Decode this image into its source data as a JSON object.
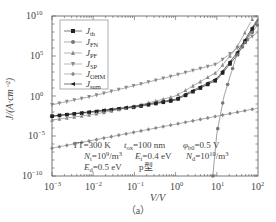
{
  "chart_data": {
    "type": "line",
    "title": "",
    "xlabel": "V/V",
    "ylabel": "J/(A·cm⁻²)",
    "xscale": "log",
    "yscale": "log",
    "xlim": [
      0.001,
      100
    ],
    "ylim": [
      1e-10,
      10000000000.0
    ],
    "x_ticks": [
      "10^-3",
      "10^-2",
      "10^-1",
      "10^0",
      "10^1",
      "10^2"
    ],
    "y_ticks": [
      "10^-10",
      "10^-5",
      "10^0",
      "10^5",
      "10^10"
    ],
    "grid": false,
    "legend_position": "upper left",
    "series": [
      {
        "name": "J_th",
        "marker": "square",
        "color": "#222222",
        "x": [
          0.001,
          0.01,
          0.1,
          1,
          10,
          30,
          100
        ],
        "y": [
          0.003,
          0.01,
          0.04,
          0.3,
          100,
          100000.0,
          3000000000.0
        ]
      },
      {
        "name": "J_FN",
        "marker": "circle",
        "color": "#777777",
        "x": [
          8,
          10,
          15,
          30,
          100
        ],
        "y": [
          1e-10,
          2e-05,
          1,
          100000.0,
          1000000000.0
        ]
      },
      {
        "name": "J_PF",
        "marker": "triangle-up",
        "color": "#888888",
        "x": [
          0.001,
          0.01,
          0.1,
          1,
          10,
          30,
          80
        ],
        "y": [
          0.001,
          0.005,
          0.05,
          1,
          1000,
          1000000.0,
          10000000000.0
        ]
      },
      {
        "name": "J_SP",
        "marker": "triangle-down",
        "color": "#888888",
        "x": [
          0.001,
          0.01,
          0.1,
          1,
          10,
          100
        ],
        "y": [
          0.08,
          1,
          20,
          400,
          10000.0,
          100000000.0
        ]
      },
      {
        "name": "J_OHM",
        "marker": "diamond",
        "color": "#888888",
        "x": [
          0.001,
          0.01,
          0.1,
          1,
          10,
          100
        ],
        "y": [
          3e-07,
          3e-06,
          3e-05,
          0.0003,
          0.003,
          0.03
        ]
      },
      {
        "name": "J_sum",
        "marker": "triangle-left",
        "color": "#222222",
        "x": [
          0.001,
          0.01,
          0.1,
          1,
          10,
          30,
          100
        ],
        "y": [
          0.003,
          0.012,
          0.05,
          0.4,
          150,
          200000.0,
          5000000000.0
        ]
      }
    ],
    "annotations": [
      "T=300 K",
      "t_ox=100 nm",
      "φ_b0=0.5 V",
      "N_t=10^9/m^3",
      "E_t=0.4 eV",
      "N_d=10^10/m^3",
      "E_d=0.5 eV",
      "p型"
    ]
  },
  "axes": {
    "xlabel": "V/V",
    "ylabel": "J/(A·cm⁻²)",
    "x_ticks": [
      {
        "base": "10",
        "exp": "−3"
      },
      {
        "base": "10",
        "exp": "−2"
      },
      {
        "base": "10",
        "exp": "−1"
      },
      {
        "base": "10",
        "exp": "0"
      },
      {
        "base": "10",
        "exp": "1"
      },
      {
        "base": "10",
        "exp": "2"
      }
    ],
    "y_ticks": [
      {
        "base": "10",
        "exp": "10"
      },
      {
        "base": "10",
        "exp": "5"
      },
      {
        "base": "10",
        "exp": "0"
      },
      {
        "base": "10",
        "exp": "−5"
      },
      {
        "base": "10",
        "exp": "−10"
      }
    ]
  },
  "legend": [
    {
      "main": "J",
      "sub": "th"
    },
    {
      "main": "J",
      "sub": "FN"
    },
    {
      "main": "J",
      "sub": "PF"
    },
    {
      "main": "J",
      "sub": "SP"
    },
    {
      "main": "J",
      "sub": "OHM"
    },
    {
      "main": "J",
      "sub": "sum"
    }
  ],
  "annotations": {
    "line1": [
      {
        "text": "T=300 K"
      },
      {
        "main": "t",
        "sub": "ox",
        "rest": "=100 nm"
      },
      {
        "main": "φ",
        "sub": "b0",
        "rest": "=0.5 V"
      }
    ],
    "line2": [
      {
        "main": "N",
        "sub": "t",
        "rest": "=10",
        "sup": "9",
        "tail": "/m",
        "sup2": "3"
      },
      {
        "main": "E",
        "sub": "t",
        "rest": "=0.4 eV"
      },
      {
        "main": "N",
        "sub": "d",
        "rest": "=10",
        "sup": "10",
        "tail": "/m",
        "sup2": "3"
      }
    ],
    "line3": [
      {
        "main": "E",
        "sub": "d",
        "rest": "=0.5 eV"
      },
      {
        "text": "p型"
      }
    ]
  },
  "caption": "（a）"
}
